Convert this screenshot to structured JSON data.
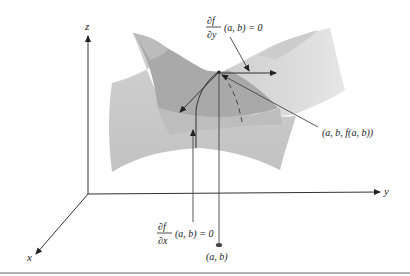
{
  "figure": {
    "axes": {
      "x_label": "x",
      "y_label": "y",
      "z_label": "z"
    },
    "annotations": {
      "partial_y": {
        "numerator": "∂f",
        "denominator": "∂y",
        "expression": "(a, b) = 0"
      },
      "partial_x": {
        "numerator": "∂f",
        "denominator": "∂x",
        "expression": "(a, b) = 0"
      },
      "point_on_surface": "(a, b, f(a, b))",
      "point_in_plane": "(a, b)"
    },
    "colors": {
      "surface_light": "#d9d9d9",
      "surface_mid": "#c4c4c4",
      "surface_dark": "#a9a9a9",
      "line": "#333333",
      "divider": "#9a9a9a"
    }
  }
}
